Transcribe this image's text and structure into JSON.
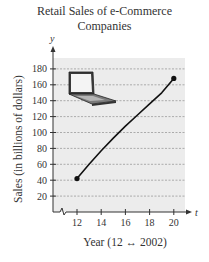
{
  "chart_data": {
    "type": "line",
    "title": "Retail Sales of e-Commerce Companies",
    "title_lines": [
      "Retail Sales of e-Commerce",
      "Companies"
    ],
    "xlabel": "Year (12 ↔ 2002)",
    "ylabel": "Sales (in billions of dollars)",
    "x_axis_var": "t",
    "y_axis_var": "y",
    "x_ticks": [
      12,
      14,
      16,
      18,
      20
    ],
    "y_ticks": [
      20,
      40,
      60,
      80,
      100,
      120,
      140,
      160,
      180
    ],
    "xlim": [
      10.5,
      21
    ],
    "ylim": [
      0,
      190
    ],
    "grid": "horizontal dashed",
    "series": [
      {
        "name": "Sales",
        "x": [
          12,
          13,
          14,
          15,
          16,
          17,
          18,
          19,
          20
        ],
        "values": [
          42,
          60,
          77,
          93,
          108,
          122,
          136,
          150,
          168
        ]
      }
    ],
    "endpoints": [
      {
        "x": 12,
        "y": 42
      },
      {
        "x": 20,
        "y": 168
      }
    ],
    "annotations": [
      "laptop illustration",
      "axis break on x-axis"
    ]
  }
}
